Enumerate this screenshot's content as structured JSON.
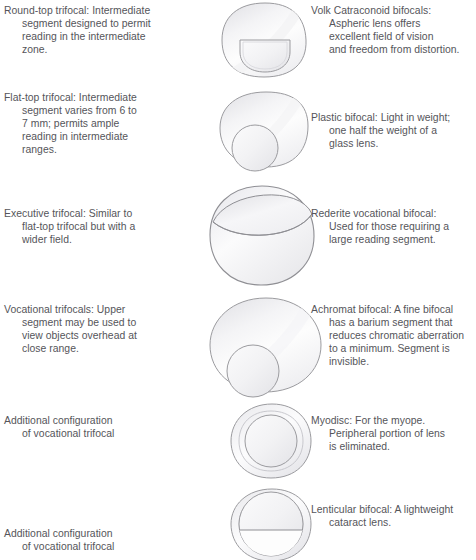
{
  "figure": {
    "background_color": "#ffffff",
    "text_color": "#55555a",
    "lens_outline_color": "#9a9a9e",
    "lens_fill_light": "#fdfdfd",
    "lens_fill_shade": "#e9e9ec"
  },
  "rows": [
    {
      "id": "row-1",
      "left_caption": "Round-top trifocal: Intermediate\nsegment designed to permit\nreading in the intermediate\nzone.",
      "right_caption": "Volk Catraconoid bifocals:\nAspheric lens offers\nexcellent field of vision\nand freedom from distortion.",
      "lens_name": "round-top-trifocal-lens",
      "lens_shape": "squircle lens with flat-top D segment"
    },
    {
      "id": "row-2",
      "left_caption": "Flat-top trifocal: Intermediate\nsegment varies from 6 to\n7 mm; permits ample\nreading in intermediate\nranges.",
      "right_caption": "Plastic bifocal: Light in weight;\none half the weight of a\nglass lens.",
      "lens_name": "flat-top-trifocal-lens",
      "lens_shape": "tapered lens with round segment at lower left"
    },
    {
      "id": "row-3",
      "left_caption": "Executive trifocal: Similar to\nflat-top trifocal but with a\nwider field.",
      "right_caption": "Rederite vocational bifocal:\nUsed for those requiring a\nlarge reading segment.",
      "lens_name": "executive-trifocal-lens",
      "lens_shape": "round lens with wide curved band across top"
    },
    {
      "id": "row-4",
      "left_caption": "Vocational trifocals: Upper\nsegment may be used to\nview objects overhead at\nclose range.",
      "right_caption": "Achromat bifocal: A fine bifocal\nhas a barium segment that\nreduces chromatic aberration\nto a minimum. Segment is\ninvisible.",
      "lens_name": "vocational-trifocal-lens",
      "lens_shape": "round lens with circular segment overlapping bottom"
    },
    {
      "id": "row-5",
      "left_caption": "Additional configuration\nof vocational trifocal",
      "right_caption": "Myodisc: For the myope.\nPeripheral portion of lens\nis eliminated.",
      "lens_name": "myodisc-lens",
      "lens_shape": "concentric circles, plain inner disc"
    },
    {
      "id": "row-6",
      "left_caption": "Additional configuration\nof vocational trifocal",
      "right_caption": "Lenticular bifocal: A lightweight\ncataract lens.",
      "lens_name": "lenticular-bifocal-lens",
      "lens_shape": "concentric circles with flat-top D segment in lower half"
    }
  ]
}
